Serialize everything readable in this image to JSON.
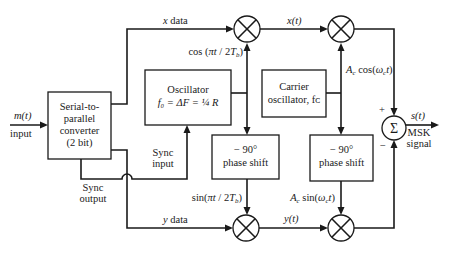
{
  "blocks": {
    "serial_to_parallel": {
      "lines": [
        "Serial-to-",
        "parallel",
        "converter",
        "(2 bit)"
      ]
    },
    "oscillator": {
      "line1": "Oscillator",
      "line2": "f₀ = ΔF = ¼ R"
    },
    "carrier_oscillator": {
      "line1": "Carrier",
      "line2": "oscillator, fᴄ"
    },
    "phase_shift_left": {
      "line1": "− 90°",
      "line2": "phase shift"
    },
    "phase_shift_right": {
      "line1": "− 90°",
      "line2": "phase shift"
    },
    "summer": {
      "symbol": "Σ",
      "plus": "+",
      "minus": "−"
    },
    "multiplier_symbol": "⊗"
  },
  "labels": {
    "input_signal": "m(t)",
    "input_text": "input",
    "x_data": "x data",
    "y_data": "y data",
    "cos_term": "cos (πt / 2Tᵦ)",
    "sin_term": "sin(πt / 2Tᵦ)",
    "x_t": "x(t)",
    "y_t": "y(t)",
    "carrier_cos": "Aᴄ cos(ωᴄt)",
    "carrier_sin": "Aᴄ sin(ωᴄt)",
    "sync_input": [
      "Sync",
      "input"
    ],
    "sync_output": [
      "Sync",
      "output"
    ],
    "output_signal": "s(t)",
    "output_text": [
      "MSK",
      "signal"
    ]
  }
}
